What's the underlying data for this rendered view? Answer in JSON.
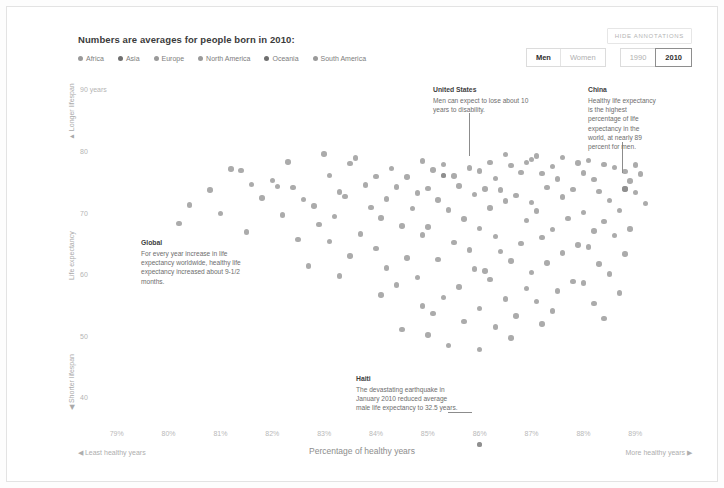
{
  "header": {
    "title": "Numbers are averages for people born in 2010:",
    "hide_annotations_label": "HIDE ANNOTATIONS"
  },
  "legend": {
    "items": [
      {
        "label": "Africa",
        "color": "#9a9a9a"
      },
      {
        "label": "Asia",
        "color": "#6f6f6f"
      },
      {
        "label": "Europe",
        "color": "#9a9a9a"
      },
      {
        "label": "North America",
        "color": "#9a9a9a"
      },
      {
        "label": "Oceania",
        "color": "#6f6f6f"
      },
      {
        "label": "South America",
        "color": "#9a9a9a"
      }
    ]
  },
  "toggles": {
    "sex": [
      {
        "label": "Men",
        "selected": true
      },
      {
        "label": "Women",
        "selected": false
      }
    ],
    "year": [
      {
        "label": "1990",
        "selected": false
      },
      {
        "label": "2010",
        "selected": true
      }
    ]
  },
  "axis_labels": {
    "y_axis_title": "Life expectancy",
    "y_top_arrow": "▲ Longer lifespan",
    "y_bottom_arrow": "◀ Shorter lifespan",
    "x_axis_title": "Percentage of healthy years",
    "x_left_arrow": "◀ Least healthy years",
    "x_right_arrow": "More healthy years ▶"
  },
  "annotations": [
    {
      "key": "united_states",
      "title": "United States",
      "body": "Men can expect to lose about 10 years to disability."
    },
    {
      "key": "china",
      "title": "China",
      "body": "Healthy life expectancy is the highest percentage of life expectancy in the world, at nearly 89 percent for men."
    },
    {
      "key": "global",
      "title": "Global",
      "body": "For every year increase in life expectancy worldwide, healthy life expectancy increased about 9-1/2 months."
    },
    {
      "key": "haiti",
      "title": "Haiti",
      "body": "The devastating earthquake in January 2010 reduced average male life expectancy to 32.5 years."
    }
  ],
  "chart_data": {
    "type": "scatter",
    "title": "Numbers are averages for people born in 2010:",
    "xlabel": "Percentage of healthy years",
    "ylabel": "Life expectancy",
    "xlim": [
      78.6,
      89.4
    ],
    "ylim": [
      36.0,
      92.0
    ],
    "grid": false,
    "legend_position": "top-left",
    "xticks": [
      "79%",
      "80%",
      "81%",
      "82%",
      "83%",
      "84%",
      "85%",
      "86%",
      "87%",
      "88%",
      "89%"
    ],
    "xtick_values": [
      79,
      80,
      81,
      82,
      83,
      84,
      85,
      86,
      87,
      88,
      89
    ],
    "yticks": [
      "90 years",
      "80",
      "70",
      "60",
      "50",
      "40"
    ],
    "ytick_values": [
      90,
      80,
      70,
      60,
      50,
      40
    ],
    "point_color": "#9c9c9c",
    "highlights": [
      {
        "name": "United States",
        "x": 85.3,
        "y": 76.2
      },
      {
        "name": "China",
        "x": 88.8,
        "y": 74.0
      },
      {
        "name": "Haiti",
        "x": 86.0,
        "y": 32.5
      }
    ],
    "points": [
      [
        83.0,
        79.7
      ],
      [
        83.6,
        79.0
      ],
      [
        86.5,
        79.6
      ],
      [
        87.1,
        79.3
      ],
      [
        87.6,
        79.1
      ],
      [
        87.0,
        78.8
      ],
      [
        88.1,
        78.6
      ],
      [
        86.9,
        78.3
      ],
      [
        87.9,
        78.2
      ],
      [
        88.4,
        78.0
      ],
      [
        82.3,
        78.4
      ],
      [
        83.5,
        78.1
      ],
      [
        84.9,
        78.5
      ],
      [
        85.3,
        78.0
      ],
      [
        86.2,
        78.3
      ],
      [
        86.6,
        77.8
      ],
      [
        87.4,
        77.6
      ],
      [
        88.6,
        77.5
      ],
      [
        89.0,
        77.9
      ],
      [
        85.8,
        77.4
      ],
      [
        81.2,
        77.2
      ],
      [
        81.4,
        77.0
      ],
      [
        84.3,
        77.3
      ],
      [
        85.1,
        77.1
      ],
      [
        86.0,
        76.9
      ],
      [
        86.8,
        76.7
      ],
      [
        87.2,
        76.5
      ],
      [
        88.0,
        76.6
      ],
      [
        88.8,
        76.8
      ],
      [
        89.1,
        76.4
      ],
      [
        83.1,
        76.2
      ],
      [
        84.0,
        76.0
      ],
      [
        84.6,
        75.9
      ],
      [
        85.5,
        76.1
      ],
      [
        86.3,
        75.7
      ],
      [
        87.5,
        75.6
      ],
      [
        88.2,
        75.5
      ],
      [
        88.9,
        75.3
      ],
      [
        85.3,
        76.2
      ],
      [
        82.0,
        75.4
      ],
      [
        81.6,
        74.7
      ],
      [
        82.1,
        74.4
      ],
      [
        82.4,
        74.2
      ],
      [
        83.8,
        74.6
      ],
      [
        84.4,
        74.3
      ],
      [
        85.0,
        74.1
      ],
      [
        85.6,
        74.5
      ],
      [
        86.1,
        74.0
      ],
      [
        86.4,
        73.8
      ],
      [
        87.3,
        74.2
      ],
      [
        87.8,
        73.9
      ],
      [
        88.3,
        73.6
      ],
      [
        88.8,
        74.0
      ],
      [
        89.0,
        73.4
      ],
      [
        80.8,
        73.8
      ],
      [
        83.3,
        73.5
      ],
      [
        84.8,
        73.3
      ],
      [
        85.9,
        73.1
      ],
      [
        86.7,
        72.9
      ],
      [
        87.6,
        72.7
      ],
      [
        81.8,
        72.5
      ],
      [
        82.6,
        72.3
      ],
      [
        83.4,
        72.8
      ],
      [
        84.2,
        72.4
      ],
      [
        85.2,
        72.2
      ],
      [
        86.5,
        72.0
      ],
      [
        87.0,
        71.8
      ],
      [
        88.5,
        72.1
      ],
      [
        89.2,
        71.6
      ],
      [
        80.4,
        71.4
      ],
      [
        82.8,
        71.2
      ],
      [
        83.9,
        71.0
      ],
      [
        84.7,
        70.8
      ],
      [
        85.4,
        70.6
      ],
      [
        86.2,
        70.9
      ],
      [
        87.1,
        70.4
      ],
      [
        88.0,
        70.2
      ],
      [
        88.7,
        70.5
      ],
      [
        81.0,
        70.0
      ],
      [
        82.2,
        69.8
      ],
      [
        83.2,
        69.5
      ],
      [
        84.1,
        69.3
      ],
      [
        85.7,
        69.1
      ],
      [
        86.9,
        68.9
      ],
      [
        87.7,
        69.2
      ],
      [
        88.4,
        68.7
      ],
      [
        80.2,
        68.4
      ],
      [
        82.9,
        68.2
      ],
      [
        84.5,
        68.0
      ],
      [
        85.0,
        67.8
      ],
      [
        86.0,
        67.6
      ],
      [
        87.4,
        67.4
      ],
      [
        88.2,
        67.2
      ],
      [
        88.9,
        67.5
      ],
      [
        81.5,
        67.0
      ],
      [
        83.7,
        66.7
      ],
      [
        84.9,
        66.5
      ],
      [
        86.3,
        66.3
      ],
      [
        87.2,
        66.1
      ],
      [
        88.6,
        66.4
      ],
      [
        82.5,
        65.8
      ],
      [
        83.1,
        65.5
      ],
      [
        85.5,
        65.3
      ],
      [
        86.8,
        65.1
      ],
      [
        87.9,
        64.9
      ],
      [
        88.1,
        64.6
      ],
      [
        84.0,
        64.3
      ],
      [
        85.8,
        64.1
      ],
      [
        86.4,
        63.8
      ],
      [
        87.6,
        63.6
      ],
      [
        88.8,
        63.4
      ],
      [
        83.5,
        63.1
      ],
      [
        84.6,
        62.8
      ],
      [
        85.2,
        62.5
      ],
      [
        86.6,
        62.3
      ],
      [
        87.3,
        62.0
      ],
      [
        88.3,
        61.8
      ],
      [
        82.7,
        61.5
      ],
      [
        84.2,
        61.2
      ],
      [
        85.9,
        61.0
      ],
      [
        86.1,
        60.7
      ],
      [
        87.0,
        60.4
      ],
      [
        88.5,
        60.2
      ],
      [
        83.3,
        59.9
      ],
      [
        84.8,
        59.6
      ],
      [
        86.2,
        59.3
      ],
      [
        87.8,
        59.0
      ],
      [
        88.0,
        58.7
      ],
      [
        84.4,
        58.4
      ],
      [
        85.6,
        58.1
      ],
      [
        86.9,
        57.8
      ],
      [
        87.5,
        57.4
      ],
      [
        88.7,
        57.1
      ],
      [
        84.1,
        56.8
      ],
      [
        85.3,
        56.4
      ],
      [
        86.5,
        56.1
      ],
      [
        87.1,
        55.7
      ],
      [
        88.2,
        55.4
      ],
      [
        84.9,
        55.0
      ],
      [
        86.0,
        54.6
      ],
      [
        87.4,
        54.2
      ],
      [
        85.1,
        53.8
      ],
      [
        86.7,
        53.4
      ],
      [
        88.4,
        53.0
      ],
      [
        85.7,
        52.5
      ],
      [
        87.2,
        52.1
      ],
      [
        86.3,
        51.6
      ],
      [
        84.5,
        51.2
      ],
      [
        85.0,
        50.3
      ],
      [
        86.6,
        49.8
      ],
      [
        85.4,
        48.6
      ],
      [
        86.0,
        47.9
      ],
      [
        86.0,
        32.5
      ]
    ]
  }
}
